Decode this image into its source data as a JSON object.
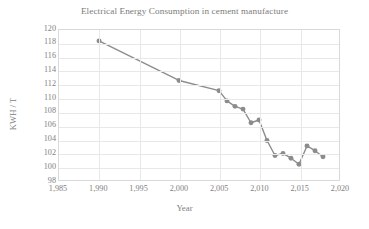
{
  "chart_data": {
    "type": "line",
    "title": "Electrical Energy Consumption in cement manufacture",
    "xlabel": "Year",
    "ylabel": "KWH / T",
    "xlim": [
      1985,
      2020
    ],
    "ylim": [
      98,
      120
    ],
    "ytick_step": 2,
    "xtick_step": 5,
    "grid": true,
    "legend": false,
    "marker": "circle",
    "series_color": "#8c8c8c",
    "x": [
      1990,
      2000,
      2005,
      2006,
      2007,
      2008,
      2009,
      2010,
      2011,
      2012,
      2013,
      2014,
      2015,
      2016,
      2017,
      2018
    ],
    "values": [
      118.4,
      112.6,
      111.1,
      109.6,
      108.8,
      108.4,
      106.4,
      106.8,
      103.8,
      101.6,
      101.9,
      101.2,
      100.3,
      103.0,
      102.3,
      101.4
    ],
    "ytick_labels": [
      "120",
      "118",
      "116",
      "114",
      "112",
      "110",
      "108",
      "106",
      "104",
      "102",
      "100",
      "98"
    ],
    "xtick_labels": [
      "1,985",
      "1,990",
      "1,995",
      "2,000",
      "2,005",
      "2,010",
      "2,015",
      "2,020"
    ],
    "xtick_values": [
      1985,
      1990,
      1995,
      2000,
      2005,
      2010,
      2015,
      2020
    ]
  }
}
